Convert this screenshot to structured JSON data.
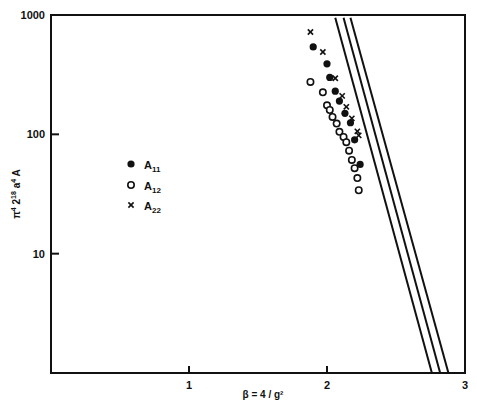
{
  "chart_data": {
    "type": "scatter",
    "title": "",
    "xlabel": "β = 4/g²",
    "ylabel": "π⁴ 2¹⁸ a⁴ A",
    "xlim": [
      0,
      3
    ],
    "ylim": [
      1,
      1000
    ],
    "yscale": "log",
    "grid": false,
    "legend_position": "left-middle",
    "x_ticks": [
      "1",
      "2",
      "3"
    ],
    "y_ticks": [
      "10",
      "100",
      "1000"
    ],
    "series": [
      {
        "name": "A11",
        "marker": "filled-circle",
        "points": [
          [
            1.9,
            540
          ],
          [
            2.0,
            390
          ],
          [
            2.02,
            300
          ],
          [
            2.06,
            230
          ],
          [
            2.09,
            190
          ],
          [
            2.13,
            150
          ],
          [
            2.17,
            125
          ],
          [
            2.2,
            90
          ],
          [
            2.24,
            56
          ]
        ]
      },
      {
        "name": "A12",
        "marker": "open-circle",
        "points": [
          [
            1.88,
            275
          ],
          [
            1.97,
            225
          ],
          [
            2.0,
            175
          ],
          [
            2.02,
            160
          ],
          [
            2.04,
            140
          ],
          [
            2.07,
            123
          ],
          [
            2.09,
            105
          ],
          [
            2.12,
            95
          ],
          [
            2.14,
            86
          ],
          [
            2.16,
            73
          ],
          [
            2.18,
            61
          ],
          [
            2.2,
            52
          ],
          [
            2.22,
            43
          ],
          [
            2.23,
            34
          ]
        ]
      },
      {
        "name": "A22",
        "marker": "cross",
        "points": [
          [
            1.88,
            720
          ],
          [
            1.97,
            490
          ],
          [
            2.06,
            295
          ],
          [
            2.11,
            210
          ],
          [
            2.14,
            170
          ],
          [
            2.18,
            136
          ],
          [
            2.22,
            106
          ],
          [
            2.23,
            98
          ]
        ]
      }
    ],
    "fit_lines": [
      {
        "name": "fit-1",
        "from": [
          2.06,
          950
        ],
        "to": [
          2.76,
          1
        ]
      },
      {
        "name": "fit-2",
        "from": [
          2.12,
          950
        ],
        "to": [
          2.82,
          1
        ]
      },
      {
        "name": "fit-3",
        "from": [
          2.17,
          950
        ],
        "to": [
          2.88,
          1
        ]
      }
    ]
  },
  "legend": {
    "items": [
      {
        "label": "A",
        "sub": "11"
      },
      {
        "label": "A",
        "sub": "12"
      },
      {
        "label": "A",
        "sub": "22"
      }
    ]
  },
  "axes": {
    "xlabel": "β = 4 / g²",
    "ylabel_parts": [
      "π",
      "4",
      " 2",
      "18",
      " a",
      "4",
      " A"
    ]
  }
}
